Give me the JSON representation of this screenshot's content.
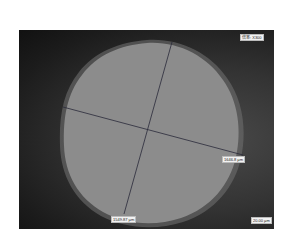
{
  "image": {
    "description": "Optical microscope image of a roughly circular particle with two perpendicular diameter measurement lines",
    "colors": {
      "background": "#1c1c1c",
      "particle": "#8a8a8a",
      "particle_edge": "#9a9a9a",
      "measure_line": "#2a2a3a"
    }
  },
  "overlay": {
    "magnification_label": "倍率: X300",
    "diameter_1_label": "1646.8 µm",
    "diameter_2_label": "1549.87 µm",
    "scale_bar_label": "20.00 µm"
  }
}
